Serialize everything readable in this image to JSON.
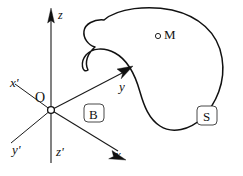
{
  "figure": {
    "kind": "coordinate-system-with-body-diagram",
    "background_color": "#ffffff",
    "stroke_color": "#111111"
  },
  "axes": {
    "origin_label": "O",
    "labels": {
      "z": "z",
      "z_prime": "z'",
      "x": "x",
      "x_prime": "x'",
      "y": "y",
      "y_prime": "y'"
    }
  },
  "annotations": {
    "frame_label": "B",
    "body_label": "S",
    "point_label": "M"
  }
}
